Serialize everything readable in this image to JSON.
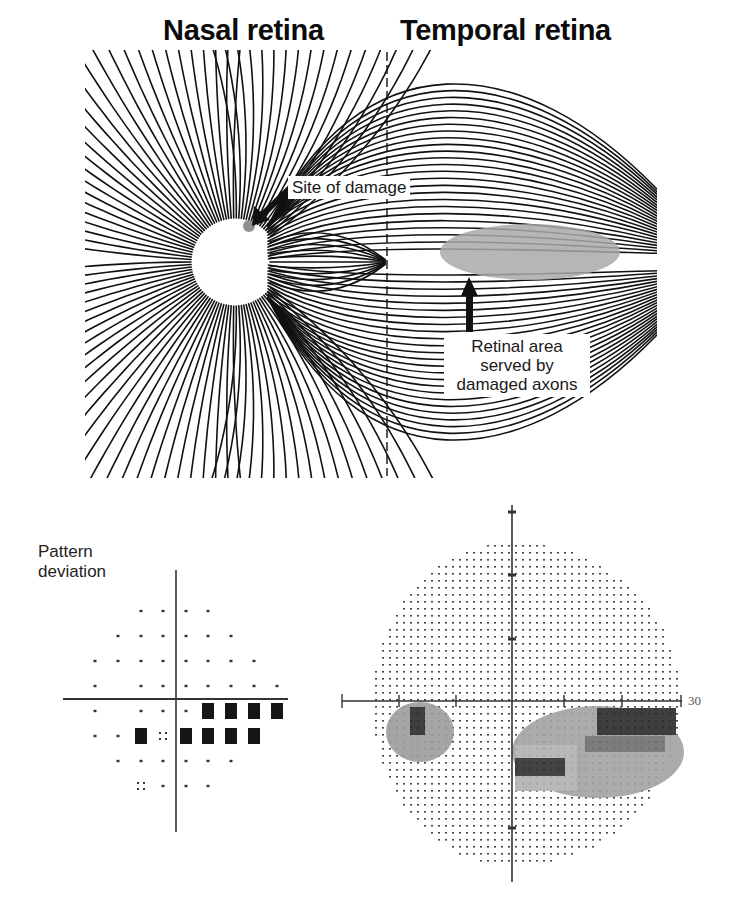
{
  "titles": {
    "nasal": "Nasal retina",
    "temporal": "Temporal retina"
  },
  "annotations": {
    "site_of_damage": "Site of damage",
    "retinal_area": [
      "Retinal area",
      "served by",
      "damaged axons"
    ]
  },
  "pattern_deviation": {
    "label_line1": "Pattern",
    "label_line2": "deviation",
    "columns_x": [
      95,
      118,
      141,
      163,
      186,
      208,
      231,
      254,
      277
    ],
    "rows": [
      {
        "y": 611,
        "cells": [
          "",
          "",
          "dot",
          "dot",
          "dot",
          "dot",
          "",
          "",
          ""
        ]
      },
      {
        "y": 636,
        "cells": [
          "",
          "dot",
          "dot",
          "dot",
          "dot",
          "dot",
          "dot",
          "",
          ""
        ]
      },
      {
        "y": 661,
        "cells": [
          "dot",
          "dot",
          "dot",
          "dot",
          "dot",
          "dot",
          "dot",
          "dot",
          ""
        ]
      },
      {
        "y": 686,
        "cells": [
          "dot",
          "",
          "dot",
          "dot",
          "dot",
          "dot",
          "dot",
          "dot",
          "dot"
        ]
      },
      {
        "y": 711,
        "cells": [
          "dot",
          "",
          "dot",
          "dot",
          "dot",
          "black",
          "black",
          "black",
          "black"
        ]
      },
      {
        "y": 736,
        "cells": [
          "dot",
          "dot",
          "black",
          "quad",
          "black",
          "black",
          "black",
          "black",
          ""
        ]
      },
      {
        "y": 761,
        "cells": [
          "",
          "dot",
          "dot",
          "dot",
          "dot",
          "dot",
          "dot",
          "",
          ""
        ]
      },
      {
        "y": 786,
        "cells": [
          "",
          "",
          "quad",
          "dot",
          "dot",
          "dot",
          "",
          "",
          ""
        ]
      }
    ]
  },
  "visual_field": {
    "axis_label": "30"
  },
  "colors": {
    "ink": "#111111",
    "damage_gray": "#8f8f8f",
    "region_gray": "#a9a9a9",
    "dark_block": "#2a2a2a"
  }
}
